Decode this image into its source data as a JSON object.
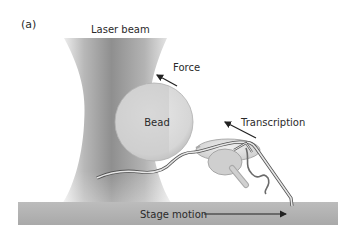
{
  "figure": {
    "panel_label": "(a)",
    "labels": {
      "laser_beam": "Laser beam",
      "force": "Force",
      "bead": "Bead",
      "transcription": "Transcription",
      "stage_motion": "Stage motion"
    },
    "colors": {
      "background": "#ffffff",
      "beam_dark": "#8f8f8f",
      "beam_light": "#ececec",
      "bead_left": "#d4d4d4",
      "bead_right": "#e6e6e6",
      "stage": "#b5b5b5",
      "text": "#2a2a2a"
    }
  }
}
